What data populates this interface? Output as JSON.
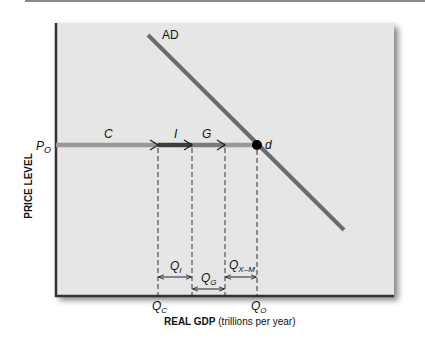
{
  "figure": {
    "curve_label": "AD",
    "y_axis_label": "PRICE LEVEL",
    "x_axis_label_bold": "REAL GDP",
    "x_axis_label_rest": " (trillions per year)",
    "price_label_main": "P",
    "price_label_sub": "O",
    "point_label": "d",
    "segments": [
      {
        "label": "C"
      },
      {
        "label": "I"
      },
      {
        "label": "G"
      }
    ],
    "quantity_labels": {
      "QI_main": "Q",
      "QI_sub": "I",
      "QG_main": "Q",
      "QG_sub": "G",
      "QXM_main": "Q",
      "QXM_sub": "X–M",
      "QC_main": "Q",
      "QC_sub": "C",
      "QO_main": "Q",
      "QO_sub": "O"
    },
    "colors": {
      "plot_bg": "#e6e6e6",
      "axis": "#333333",
      "ad_line": "#6b6b6b",
      "c_segment": "#9a9a9a",
      "i_segment": "#3d3d3d",
      "g_segment": "#7a7a7a",
      "point": "#000000"
    }
  }
}
